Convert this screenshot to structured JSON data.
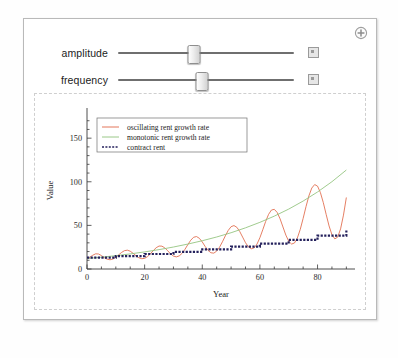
{
  "window": {
    "add_control_icon": "plus-circle-icon"
  },
  "controls": [
    {
      "label": "amplitude",
      "thumb_percent": 43,
      "open_button_icon": "expand-square-icon"
    },
    {
      "label": "frequency",
      "thumb_percent": 48,
      "open_button_icon": "expand-square-icon"
    }
  ],
  "chart_data": {
    "type": "line",
    "title": "",
    "xlabel": "Year",
    "ylabel": "Value",
    "xlim": [
      0,
      93
    ],
    "ylim": [
      0,
      180
    ],
    "xticks": [
      0,
      20,
      40,
      60,
      80
    ],
    "yticks": [
      0,
      50,
      100,
      150
    ],
    "grid": false,
    "legend_position": "upper-left-inside",
    "colors": {
      "oscillating": "#e06848",
      "monotonic": "#8fc27a",
      "contract": "#24215c"
    },
    "series": [
      {
        "name": "oscillating rent growth rate",
        "style": "solid",
        "color": "#e06848",
        "x": [
          0,
          1,
          2,
          3,
          4,
          5,
          6,
          7,
          8,
          9,
          10,
          11,
          12,
          13,
          14,
          15,
          16,
          17,
          18,
          19,
          20,
          21,
          22,
          23,
          24,
          25,
          26,
          27,
          28,
          29,
          30,
          31,
          32,
          33,
          34,
          35,
          36,
          37,
          38,
          39,
          40,
          41,
          42,
          43,
          44,
          45,
          46,
          47,
          48,
          49,
          50,
          51,
          52,
          53,
          54,
          55,
          56,
          57,
          58,
          59,
          60,
          61,
          62,
          63,
          64,
          65,
          66,
          67,
          68,
          69,
          70,
          71,
          72,
          73,
          74,
          75,
          76,
          77,
          78,
          79,
          80,
          81,
          82,
          83,
          84,
          85,
          86,
          87,
          88,
          89,
          90
        ],
        "values": [
          12,
          13.5,
          15.8,
          17.4,
          17.2,
          15.4,
          13.0,
          11.2,
          10.6,
          11.4,
          13.4,
          16.2,
          19.0,
          21.0,
          21.6,
          20.4,
          18.0,
          15.2,
          12.9,
          11.8,
          12.2,
          14.2,
          17.4,
          21.1,
          24.4,
          26.3,
          26.2,
          24.2,
          20.9,
          17.4,
          14.8,
          13.9,
          15.0,
          18.0,
          22.6,
          28.0,
          33.0,
          36.4,
          37.2,
          35.2,
          31.0,
          25.9,
          21.4,
          18.6,
          18.2,
          20.5,
          25.0,
          31.2,
          38.0,
          44.2,
          48.5,
          49.8,
          47.8,
          43.0,
          36.6,
          30.2,
          25.4,
          23.2,
          24.2,
          28.6,
          35.9,
          45.0,
          54.5,
          62.6,
          67.6,
          68.4,
          64.8,
          57.5,
          48.2,
          38.9,
          31.8,
          28.6,
          29.8,
          35.6,
          45.4,
          58.0,
          71.5,
          83.8,
          92.8,
          96.8,
          95.0,
          87.6,
          76.1,
          62.5,
          49.4,
          39.3,
          34.5,
          36.6,
          46.0,
          61.8,
          82.0
        ]
      },
      {
        "name": "monotonic rent growth rate",
        "style": "solid",
        "color": "#8fc27a",
        "x": [
          0,
          5,
          10,
          15,
          20,
          25,
          30,
          35,
          40,
          45,
          50,
          55,
          60,
          65,
          70,
          75,
          80,
          85,
          90
        ],
        "values": [
          12.0,
          13.5,
          15.3,
          17.3,
          19.6,
          22.2,
          25.2,
          28.6,
          32.4,
          36.7,
          41.6,
          47.2,
          53.5,
          60.6,
          68.7,
          77.9,
          88.3,
          100.1,
          113.5
        ]
      },
      {
        "name": "contract rent",
        "style": "dotted-step",
        "color": "#24215c",
        "x": [
          0,
          5,
          10,
          15,
          20,
          25,
          30,
          35,
          40,
          45,
          50,
          55,
          60,
          65,
          70,
          75,
          80,
          85,
          90
        ],
        "values": [
          13.0,
          13.0,
          14.8,
          14.8,
          17.2,
          17.2,
          19.6,
          19.6,
          22.4,
          22.4,
          25.6,
          25.6,
          29.2,
          29.2,
          33.4,
          33.4,
          38.2,
          38.2,
          44.0
        ]
      }
    ],
    "legend": [
      {
        "label": "oscillating rent growth rate",
        "color": "#e06848",
        "style": "solid"
      },
      {
        "label": "monotonic rent growth rate",
        "color": "#8fc27a",
        "style": "solid"
      },
      {
        "label": "contract rent",
        "color": "#24215c",
        "style": "dashed"
      }
    ]
  }
}
